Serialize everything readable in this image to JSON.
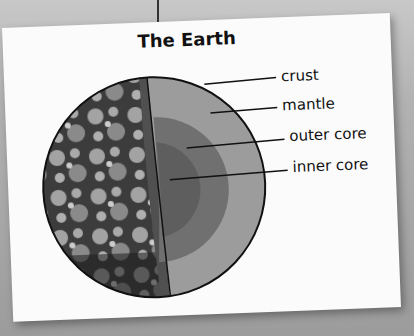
{
  "title": "The Earth",
  "labels": {
    "crust": "crust",
    "mantle": "mantle",
    "outer_core": "outer core",
    "inner_core": "inner core"
  },
  "colors": {
    "card": "#fbfbfb",
    "background": "#a8a8a8",
    "mantle": "#9c9c9c",
    "outer_core": "#6e6e6e",
    "inner_core": "#5a5a5a",
    "surface": "#3a3a3a",
    "outline": "#111111"
  }
}
